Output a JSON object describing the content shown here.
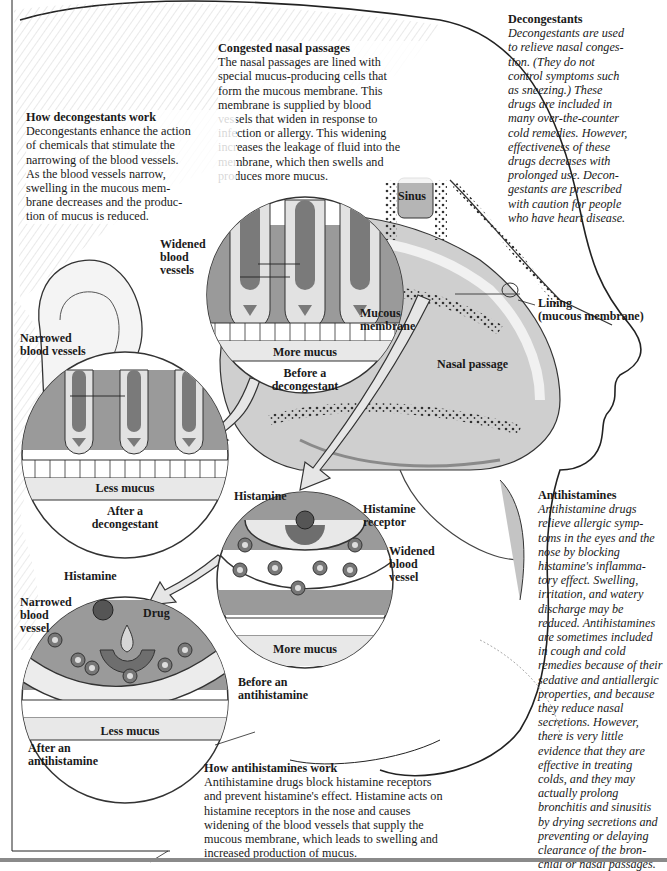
{
  "figure": {
    "colors": {
      "dark_gray": "#6e6e6e",
      "mid_gray": "#9a9a9a",
      "light_gray": "#d6d6d6",
      "paper": "#ffffff",
      "ink": "#1a1a1a"
    }
  },
  "blocks": {
    "decongestants": {
      "heading": "Decongestants",
      "body": "Decongestants are used to relieve nasal congestion. (They do not control symptoms such as sneezing.) These drugs are included in many over-the-counter cold remedies. However, effectiveness of these drugs decreases with prolonged use. Decongestants are prescribed with caution for people who have heart disease.",
      "lines": [
        "Decongestants are used",
        "to relieve nasal conges-",
        "tion. (They do not",
        "control symptoms such",
        "as sneezing.) These",
        "drugs are included in",
        "many over-the-counter",
        "cold remedies. However,",
        "effectiveness of these",
        "drugs decreases with",
        "prolonged use. Decon-",
        "gestants are prescribed",
        "with caution for people",
        "who have heart disease."
      ]
    },
    "congested": {
      "heading": "Congested nasal passages",
      "lines": [
        "The nasal passages are lined with",
        "special mucus-producing cells that",
        "form the mucous membrane. This",
        "membrane is supplied by blood",
        "vessels that widen in response to",
        "infection or allergy. This widening",
        "increases the leakage of fluid into the",
        "membrane, which then swells and",
        "produces more mucus."
      ]
    },
    "how_decongestants": {
      "heading": "How decongestants work",
      "lines": [
        "Decongestants enhance the action",
        "of chemicals that stimulate the",
        "narrowing of the blood vessels.",
        "As the blood vessels narrow,",
        "swelling in the mucous mem-",
        "brane decreases and the produc-",
        "tion of mucus is reduced."
      ]
    },
    "antihistamines": {
      "heading": "Antihistamines",
      "lines": [
        "Antihistamine drugs",
        "relieve allergic symp-",
        "toms in the eyes and the",
        "nose by blocking",
        "histamine's inflamma-",
        "tory effect. Swelling,",
        "irritation, and watery",
        "discharge may be",
        "reduced. Antihistamines",
        "are sometimes included",
        "in cough and cold",
        "remedies because of their",
        "sedative and antiallergic",
        "properties, and because",
        "they reduce nasal",
        "secretions. However,",
        "there is very little",
        "evidence that they are",
        "effective in treating",
        "colds, and they may",
        "actually prolong",
        "bronchitis and sinusitis",
        "by drying secretions and",
        "preventing or delaying",
        "clearance of the bron-",
        "chial or nasal passages."
      ]
    },
    "how_antihistamines": {
      "heading": "How antihistamines work",
      "lines": [
        "Antihistamine drugs block histamine receptors",
        "and prevent histamine's effect. Histamine acts on",
        "histamine receptors in the nose and causes",
        "widening of the blood vessels that supply the",
        "mucous membrane, which leads to swelling and",
        "increased production of mucus."
      ]
    }
  },
  "labels": {
    "widened_blood_vessels": [
      "Widened",
      "blood",
      "vessels"
    ],
    "mucous_membrane": [
      "Mucous",
      "membrane"
    ],
    "more_mucus_top": "More mucus",
    "before_decongestant": [
      "Before a",
      "decongestant"
    ],
    "narrowed_blood_vessels": [
      "Narrowed",
      "blood vessels"
    ],
    "less_mucus_left": "Less mucus",
    "after_decongestant": [
      "After a",
      "decongestant"
    ],
    "sinus": "Sinus",
    "lining": [
      "Lining",
      "(mucous membrane)"
    ],
    "nasal_passage": "Nasal passage",
    "histamine_right": "Histamine",
    "histamine_receptor": [
      "Histamine",
      "receptor"
    ],
    "widened_blood_vessel": [
      "Widened",
      "blood",
      "vessel"
    ],
    "more_mucus_bottom": "More mucus",
    "before_antihistamine": [
      "Before an",
      "antihistamine"
    ],
    "histamine_left": "Histamine",
    "narrowed_blood_vessel": [
      "Narrowed",
      "blood",
      "vessel"
    ],
    "drug": "Drug",
    "less_mucus_bottom": "Less mucus",
    "after_antihistamine": [
      "After an",
      "antihistamine"
    ]
  }
}
